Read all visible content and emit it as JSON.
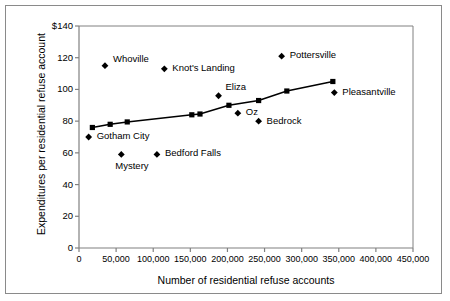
{
  "chart_data": {
    "type": "scatter",
    "title": "",
    "xlabel": "Number of residential refuse accounts",
    "ylabel": "Expenditures per residential refuse account",
    "xlim": [
      0,
      450000
    ],
    "ylim": [
      0,
      140
    ],
    "grid": false,
    "legend": "none",
    "xticks": [
      "0",
      "50,000",
      "100,000",
      "150,000",
      "200,000",
      "250,000",
      "300,000",
      "350,000",
      "400,000",
      "450,000"
    ],
    "xtick_values": [
      0,
      50000,
      100000,
      150000,
      200000,
      250000,
      300000,
      350000,
      400000,
      450000
    ],
    "yticks": [
      "0",
      "20",
      "40",
      "60",
      "80",
      "100",
      "120",
      "$140"
    ],
    "ytick_values": [
      0,
      20,
      40,
      60,
      80,
      100,
      120,
      140
    ],
    "series": [
      {
        "name": "Cities",
        "marker": "diamond",
        "points": [
          {
            "label": "Whoville",
            "x": 35000,
            "y": 115,
            "label_dx": 8,
            "label_dy": -11
          },
          {
            "label": "Gotham City",
            "x": 13000,
            "y": 70,
            "label_dx": 8,
            "label_dy": -5
          },
          {
            "label": "Knot's Landing",
            "x": 115000,
            "y": 113,
            "label_dx": 8,
            "label_dy": -5
          },
          {
            "label": "Mystery",
            "x": 57000,
            "y": 59,
            "label_dx": -6,
            "label_dy": 8
          },
          {
            "label": "Bedford Falls",
            "x": 105000,
            "y": 59,
            "label_dx": 8,
            "label_dy": -5
          },
          {
            "label": "Eliza",
            "x": 188000,
            "y": 96,
            "label_dx": 7,
            "label_dy": -13
          },
          {
            "label": "Oz",
            "x": 214000,
            "y": 85,
            "label_dx": 8,
            "label_dy": -5
          },
          {
            "label": "Bedrock",
            "x": 242000,
            "y": 80,
            "label_dx": 8,
            "label_dy": -4
          },
          {
            "label": "Pottersville",
            "x": 273000,
            "y": 121,
            "label_dx": 8,
            "label_dy": -5
          },
          {
            "label": "Pleasantville",
            "x": 344000,
            "y": 98,
            "label_dx": 8,
            "label_dy": -5
          }
        ]
      },
      {
        "name": "Trend",
        "marker": "square",
        "line": true,
        "points": [
          {
            "x": 18000,
            "y": 76
          },
          {
            "x": 42000,
            "y": 78
          },
          {
            "x": 65000,
            "y": 79.5
          },
          {
            "x": 152000,
            "y": 84
          },
          {
            "x": 163000,
            "y": 84.5
          },
          {
            "x": 202000,
            "y": 90
          },
          {
            "x": 242000,
            "y": 93
          },
          {
            "x": 280000,
            "y": 99
          },
          {
            "x": 342000,
            "y": 105
          }
        ]
      }
    ]
  },
  "colors": {
    "marker": "#000000",
    "axis": "#808080",
    "frame": "#8a8a8a",
    "line": "#000000",
    "text": "#000000"
  }
}
